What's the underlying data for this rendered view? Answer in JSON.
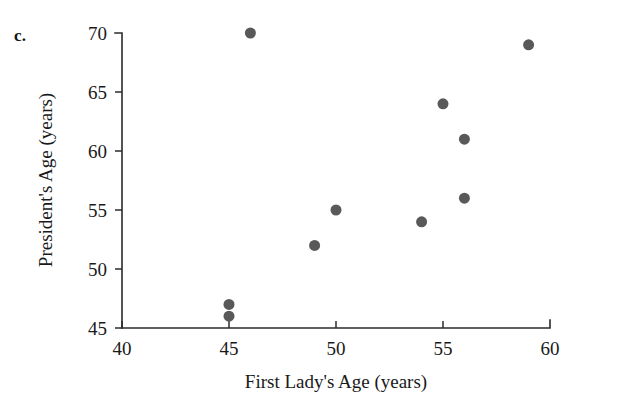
{
  "panel": {
    "label": "c."
  },
  "chart_data": {
    "type": "scatter",
    "title": "",
    "xlabel": "First Lady's Age (years)",
    "ylabel": "President's Age (years)",
    "xlim": [
      40,
      60
    ],
    "ylim": [
      45,
      70
    ],
    "xticks": [
      40,
      45,
      50,
      55,
      60
    ],
    "yticks": [
      45,
      50,
      55,
      60,
      65,
      70
    ],
    "xticklabels": [
      "40",
      "45",
      "50",
      "55",
      "60"
    ],
    "yticklabels": [
      "45",
      "50",
      "55",
      "60",
      "65",
      "70"
    ],
    "grid": false,
    "legend": null,
    "marker_color": "#595959",
    "marker_size": 11,
    "points": [
      {
        "x": 45,
        "y": 46
      },
      {
        "x": 45,
        "y": 47
      },
      {
        "x": 46,
        "y": 70
      },
      {
        "x": 49,
        "y": 52
      },
      {
        "x": 50,
        "y": 55
      },
      {
        "x": 54,
        "y": 54
      },
      {
        "x": 55,
        "y": 64
      },
      {
        "x": 56,
        "y": 56
      },
      {
        "x": 56,
        "y": 61
      },
      {
        "x": 59,
        "y": 69
      }
    ]
  }
}
